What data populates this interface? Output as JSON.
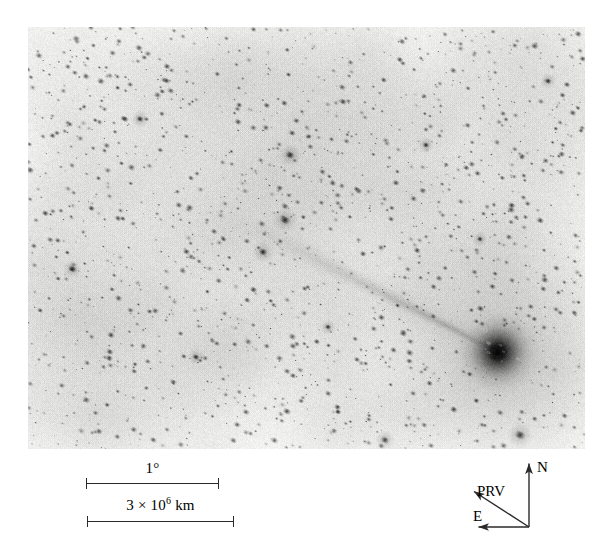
{
  "figure": {
    "kind": "astronomical-negative-image",
    "background_color": "#f2f2f0",
    "ink_color": "#2a2a2a"
  },
  "sky_image": {
    "label": "comet-field-negative",
    "frame": {
      "x": 28,
      "y": 27,
      "width": 557,
      "height": 422
    },
    "description": "Negative (inverted) wide-field photographic plate showing a dark comet coma at lower right with a narrow ion tail streaming toward the upper left across a dense field of short trailed star images.",
    "comet": {
      "nucleus_x": 470,
      "nucleus_y": 325,
      "coma_radius": 46,
      "tail_angle_deg": 207,
      "tail_length": 330,
      "tail_half_width": 7
    },
    "bright_stars": [
      {
        "x": 262,
        "y": 128,
        "r": 3.6
      },
      {
        "x": 257,
        "y": 193,
        "r": 4.0
      },
      {
        "x": 235,
        "y": 225,
        "r": 3.4
      },
      {
        "x": 492,
        "y": 408,
        "r": 4.2
      },
      {
        "x": 357,
        "y": 413,
        "r": 3.2
      },
      {
        "x": 44,
        "y": 242,
        "r": 3.0
      },
      {
        "x": 112,
        "y": 92,
        "r": 2.8
      },
      {
        "x": 398,
        "y": 118,
        "r": 2.6
      },
      {
        "x": 520,
        "y": 54,
        "r": 2.6
      },
      {
        "x": 168,
        "y": 330,
        "r": 2.6
      },
      {
        "x": 300,
        "y": 300,
        "r": 2.4
      },
      {
        "x": 452,
        "y": 212,
        "r": 2.4
      }
    ],
    "star_field": {
      "count": 1500,
      "trail_angle_deg": 28,
      "trail_length": 4.2,
      "trail_width": 2.0
    }
  },
  "scale_bars": [
    {
      "name": "angular-scale",
      "label": "1",
      "unit": "°",
      "bar": {
        "x": 86,
        "y": 483,
        "length": 133
      }
    },
    {
      "name": "linear-scale",
      "label_mantissa": "3 × 10",
      "label_exponent": "6",
      "label_unit": "km",
      "bar": {
        "x": 87,
        "y": 521,
        "length": 147
      }
    }
  ],
  "compass": {
    "north_label": "N",
    "east_label": "E",
    "prv_label": "PRV",
    "origin": {
      "x": 529,
      "y": 527
    },
    "north_tip": {
      "x": 529,
      "y": 462
    },
    "east_tip": {
      "x": 477,
      "y": 527
    },
    "prv_tip": {
      "x": 472,
      "y": 490
    }
  }
}
